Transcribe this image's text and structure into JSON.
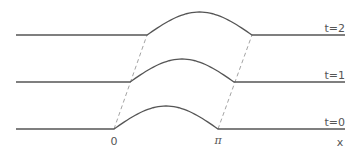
{
  "diagram": {
    "title": "",
    "colors": {
      "curve": "#555555",
      "dashed": "#999999",
      "text": "#555555",
      "background": "#ffffff"
    },
    "axis": {
      "x_label": "x",
      "ticks": [
        {
          "label": "0",
          "value": 0
        },
        {
          "label": "π",
          "value": 3.14159
        }
      ]
    },
    "profiles": [
      {
        "label": "t=2",
        "time": 2,
        "baseline_y": 35,
        "hump_start_x": 147,
        "hump_end_x": 252,
        "peak_height": 23
      },
      {
        "label": "t=1",
        "time": 1,
        "baseline_y": 82,
        "hump_start_x": 130,
        "hump_end_x": 234,
        "peak_height": 23
      },
      {
        "label": "t=0",
        "time": 0,
        "baseline_y": 129,
        "hump_start_x": 114,
        "hump_end_x": 218,
        "peak_height": 23
      }
    ],
    "line_x_start": 16,
    "line_x_end": 345,
    "dashed_characteristics": [
      {
        "name": "left-characteristic",
        "from": [
          114,
          129
        ],
        "to": [
          147,
          35
        ]
      },
      {
        "name": "right-characteristic",
        "from": [
          218,
          129
        ],
        "to": [
          252,
          35
        ]
      }
    ]
  }
}
